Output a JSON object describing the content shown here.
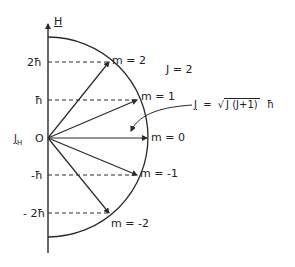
{
  "axis": {
    "vertical_label": "H",
    "horizontal_label": "J",
    "horizontal_label_subscript": "H",
    "origin_label": "O"
  },
  "ticks": [
    {
      "label": "2ħ",
      "value": 2
    },
    {
      "label": "ħ",
      "value": 1
    },
    {
      "label": "-ħ",
      "value": -1
    },
    {
      "label": "- 2ħ",
      "value": -2
    }
  ],
  "vectors": [
    {
      "label": "m = 2",
      "m": 2
    },
    {
      "label": "m = 1",
      "m": 1
    },
    {
      "label": "m = 0",
      "m": 0
    },
    {
      "label": "m = -1",
      "m": -1
    },
    {
      "label": "m = -2",
      "m": -2
    }
  ],
  "j_label": "J = 2",
  "formula": {
    "lhs": "J",
    "equals": "=",
    "sqrt_content": "J (J+1)",
    "suffix": "ħ"
  },
  "colors": {
    "line": "#2a2a2a",
    "background": "#ffffff"
  }
}
